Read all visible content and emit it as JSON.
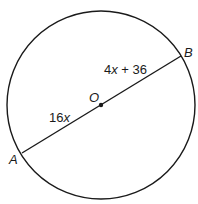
{
  "diagram": {
    "type": "circle-with-diameter",
    "circle": {
      "cx": 101,
      "cy": 105,
      "r": 94
    },
    "center": {
      "label": "O",
      "x": 101,
      "y": 105
    },
    "points": [
      {
        "label": "A",
        "x": 22,
        "y": 153
      },
      {
        "label": "B",
        "x": 181,
        "y": 56
      }
    ],
    "segments": [
      {
        "from": "A",
        "to": "O",
        "label_coef": "16",
        "label_var": "x"
      },
      {
        "from": "O",
        "to": "B",
        "label_coef": "4",
        "label_var": "x",
        "label_rest": " + 36"
      }
    ],
    "colors": {
      "stroke": "#1a1a1a",
      "background": "#ffffff"
    }
  }
}
